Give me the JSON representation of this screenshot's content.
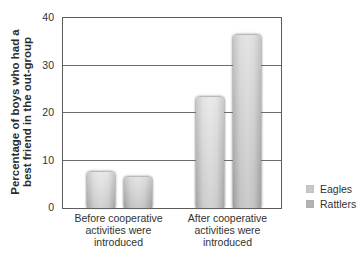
{
  "figure": {
    "background": "#ffffff",
    "text_color": "#323232",
    "axis_color": "#5c5c5c",
    "grid_color": "#6b6b6b"
  },
  "chart_data": {
    "type": "bar",
    "title": "",
    "xlabel": "",
    "ylabel": "Percentage of boys who had a best friend in the out-group",
    "ylabel_lines": [
      "Percentage of boys who had a",
      "best friend in the out-group"
    ],
    "categories": [
      {
        "key": "before",
        "lines": [
          "Before cooperative",
          "activities were",
          "introduced"
        ]
      },
      {
        "key": "after",
        "lines": [
          "After cooperative",
          "activities were",
          "introduced"
        ]
      }
    ],
    "series": [
      {
        "name": "Eagles",
        "values": [
          7.5,
          23.3
        ],
        "fill": "#d5d5d5",
        "fill_light": "#dedede",
        "edge": "#adadad",
        "legend_swatch": "#c8c8c8"
      },
      {
        "name": "Rattlers",
        "values": [
          6.5,
          36.5
        ],
        "fill": "#cccccc",
        "fill_light": "#d6d6d6",
        "edge": "#a6a6a6",
        "legend_swatch": "#b4b4b4"
      }
    ],
    "ylim": [
      0,
      40
    ],
    "yticks": [
      0,
      10,
      20,
      30,
      40
    ],
    "grid": true,
    "legend_position": "right"
  }
}
